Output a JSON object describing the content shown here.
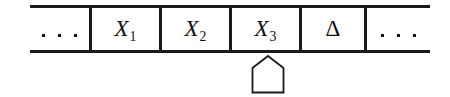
{
  "diagram": {
    "type": "turing-machine-tape",
    "colors": {
      "ink": "#111111",
      "rule": "#1a1a1a",
      "background": "#ffffff"
    },
    "tape": {
      "cells": [
        {
          "id": "cell-left-ellipsis",
          "kind": "ellipsis",
          "label": "...",
          "dot_count": 3
        },
        {
          "id": "cell-x1",
          "kind": "symbol",
          "base": "X",
          "subscript": "1",
          "label": "X1"
        },
        {
          "id": "cell-x2",
          "kind": "symbol",
          "base": "X",
          "subscript": "2",
          "label": "X2"
        },
        {
          "id": "cell-x3",
          "kind": "symbol",
          "base": "X",
          "subscript": "3",
          "label": "X3"
        },
        {
          "id": "cell-delta",
          "kind": "symbol",
          "base": "Δ",
          "subscript": "",
          "label": "Δ"
        },
        {
          "id": "cell-right-ellipsis",
          "kind": "ellipsis",
          "label": "...",
          "dot_count": 3
        }
      ]
    },
    "head": {
      "shape": "pentagon-house",
      "points_to_cell": "cell-x3",
      "label": "read-write head"
    }
  }
}
